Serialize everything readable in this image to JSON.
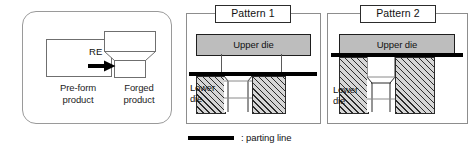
{
  "diagram": {
    "colors": {
      "die_fill": "#bdbdbd",
      "hatch_line": "#2b2b2b",
      "parting_line": "#000000",
      "panel_border": "#8d8d8d",
      "outline": "#6f6f6f"
    }
  },
  "process_panel": {
    "preform": {
      "label": "Pre-form\nproduct",
      "shape": "rectangle"
    },
    "arrow": {
      "label": "RE",
      "icon": "right-arrow-icon"
    },
    "forged": {
      "label": "Forged\nproduct",
      "shape": "stepped-tapered-block"
    }
  },
  "patterns": [
    {
      "title": "Pattern 1",
      "upper_die_label": "Upper die",
      "lower_die_label": "Lower\ndie",
      "parting_line_position": "below-upper-die"
    },
    {
      "title": "Pattern 2",
      "upper_die_label": "Upper die",
      "lower_die_label": "Lower\ndie",
      "parting_line_position": "at-upper-die-base"
    }
  ],
  "legend": {
    "swatch": "thick-black-line",
    "text": ": parting line"
  }
}
